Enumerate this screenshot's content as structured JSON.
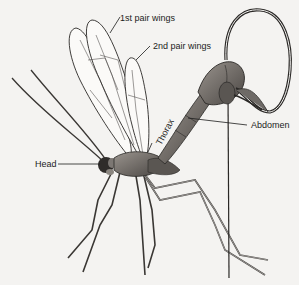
{
  "figure": {
    "labels": {
      "first_wings": "1st pair wings",
      "second_wings": "2nd pair wings",
      "thorax": "Thorax",
      "abdomen": "Abdomen",
      "head": "Head"
    },
    "colors": {
      "background": "#f4f3f1",
      "ink": "#1c1c1c",
      "body_shade": "#6e6a66",
      "body_dark": "#3a3734"
    }
  }
}
